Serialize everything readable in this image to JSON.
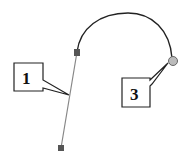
{
  "diagram": {
    "labels": [
      {
        "id": "1",
        "text": "1"
      },
      {
        "id": "3",
        "text": "3"
      }
    ],
    "colors": {
      "stroke": "#222222",
      "line": "#777777",
      "handle": "#555555",
      "endpoint": "#bbbbbb"
    }
  }
}
